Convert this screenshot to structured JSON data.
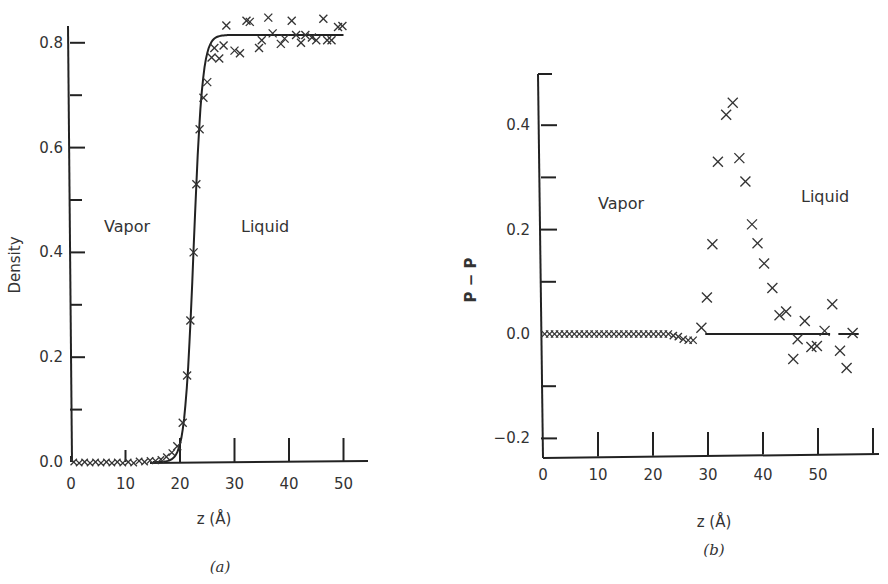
{
  "chart_data": [
    {
      "id": "a",
      "type": "scatter",
      "caption": "(a)",
      "title": "",
      "xlabel": "z (Å)",
      "ylabel": "Density",
      "xlim": [
        0,
        55
      ],
      "ylim": [
        0.0,
        0.85
      ],
      "xticks": [
        0,
        10,
        20,
        30,
        40,
        50
      ],
      "yticks": [
        0.0,
        0.2,
        0.4,
        0.6,
        0.8
      ],
      "ytick_labels": [
        "0.0",
        "0.2",
        "0.4",
        "0.6",
        "0.8"
      ],
      "minor_yticks": [
        0.1,
        0.3,
        0.5,
        0.7
      ],
      "grid": false,
      "annotations": [
        {
          "text": "Vapor",
          "x": 8,
          "y": 0.43
        },
        {
          "text": "Liquid",
          "x": 32,
          "y": 0.43
        }
      ],
      "series": [
        {
          "name": "simulation",
          "style": "x-markers",
          "points": [
            [
              0.5,
              0.0
            ],
            [
              1.5,
              -0.002
            ],
            [
              2.5,
              0.0
            ],
            [
              3.5,
              -0.002
            ],
            [
              4.5,
              0.0
            ],
            [
              5.5,
              -0.002
            ],
            [
              6.5,
              0.0
            ],
            [
              7.5,
              -0.002
            ],
            [
              8.5,
              0.0
            ],
            [
              9.5,
              -0.002
            ],
            [
              10.5,
              0.0
            ],
            [
              11.5,
              -0.002
            ],
            [
              12.5,
              0.002
            ],
            [
              13.5,
              0.0
            ],
            [
              14.5,
              0.003
            ],
            [
              15.5,
              0.002
            ],
            [
              16.5,
              0.005
            ],
            [
              17.5,
              0.01
            ],
            [
              18.5,
              0.018
            ],
            [
              19.5,
              0.03
            ],
            [
              20.5,
              0.075
            ],
            [
              21.3,
              0.165
            ],
            [
              21.9,
              0.27
            ],
            [
              22.5,
              0.4
            ],
            [
              23.0,
              0.53
            ],
            [
              23.6,
              0.635
            ],
            [
              24.3,
              0.695
            ],
            [
              25.0,
              0.725
            ],
            [
              25.8,
              0.772
            ],
            [
              26.3,
              0.79
            ],
            [
              27.2,
              0.77
            ],
            [
              28.0,
              0.795
            ],
            [
              28.5,
              0.833
            ],
            [
              30.0,
              0.785
            ],
            [
              31.0,
              0.78
            ],
            [
              32.2,
              0.842
            ],
            [
              32.8,
              0.84
            ],
            [
              34.5,
              0.79
            ],
            [
              35.0,
              0.805
            ],
            [
              36.2,
              0.848
            ],
            [
              37.0,
              0.818
            ],
            [
              38.5,
              0.798
            ],
            [
              39.2,
              0.808
            ],
            [
              40.5,
              0.842
            ],
            [
              41.3,
              0.815
            ],
            [
              42.2,
              0.8
            ],
            [
              43.0,
              0.815
            ],
            [
              44.2,
              0.81
            ],
            [
              45.0,
              0.805
            ],
            [
              46.3,
              0.846
            ],
            [
              47.0,
              0.805
            ],
            [
              47.8,
              0.805
            ],
            [
              49.0,
              0.83
            ],
            [
              49.8,
              0.832
            ]
          ]
        },
        {
          "name": "fit",
          "style": "line",
          "function": "tanh profile",
          "x_range": [
            15,
            50
          ],
          "rho_vapor": 0.0,
          "rho_liquid": 0.815,
          "z0": 22.5,
          "width": 1.6
        }
      ]
    },
    {
      "id": "b",
      "type": "scatter",
      "caption": "(b)",
      "title": "",
      "xlabel": "z (Å)",
      "ylabel": "P − P",
      "xlim": [
        0,
        60
      ],
      "ylim": [
        -0.22,
        0.5
      ],
      "xticks": [
        0,
        10,
        20,
        30,
        40,
        50,
        60
      ],
      "xtick_labels": [
        "0",
        "10",
        "20",
        "30",
        "40",
        "50",
        ""
      ],
      "yticks": [
        -0.2,
        0.0,
        0.2,
        0.4
      ],
      "ytick_labels": [
        "−0.2",
        "0.0",
        "0.2",
        "0.4"
      ],
      "minor_yticks": [
        -0.1,
        0.1,
        0.3,
        0.5
      ],
      "grid": false,
      "annotations": [
        {
          "text": "Vapor",
          "x": 10,
          "y": 0.22
        },
        {
          "text": "Liquid",
          "x": 51,
          "y": 0.23
        }
      ],
      "series": [
        {
          "name": "simulation",
          "style": "x-markers",
          "points": [
            [
              0.3,
              0.0
            ],
            [
              1.2,
              0.0
            ],
            [
              2.1,
              0.0
            ],
            [
              3.0,
              0.0
            ],
            [
              3.9,
              0.0
            ],
            [
              4.8,
              0.0
            ],
            [
              5.7,
              0.0
            ],
            [
              6.6,
              0.0
            ],
            [
              7.5,
              0.0
            ],
            [
              8.4,
              0.0
            ],
            [
              9.3,
              0.0
            ],
            [
              10.2,
              0.0
            ],
            [
              11.1,
              0.0
            ],
            [
              12.0,
              0.0
            ],
            [
              12.9,
              0.0
            ],
            [
              13.8,
              0.0
            ],
            [
              14.7,
              0.0
            ],
            [
              15.6,
              0.0
            ],
            [
              16.5,
              0.0
            ],
            [
              17.4,
              0.0
            ],
            [
              18.3,
              0.0
            ],
            [
              19.2,
              0.0
            ],
            [
              20.1,
              0.0
            ],
            [
              21.0,
              0.0
            ],
            [
              21.9,
              0.0
            ],
            [
              22.8,
              0.0
            ],
            [
              23.7,
              -0.003
            ],
            [
              24.6,
              -0.005
            ],
            [
              25.5,
              -0.01
            ],
            [
              26.4,
              -0.012
            ],
            [
              27.3,
              -0.012
            ],
            [
              28.8,
              0.012
            ],
            [
              29.8,
              0.07
            ],
            [
              30.8,
              0.172
            ],
            [
              31.8,
              0.33
            ],
            [
              33.3,
              0.42
            ],
            [
              34.5,
              0.443
            ],
            [
              35.7,
              0.337
            ],
            [
              36.8,
              0.292
            ],
            [
              38.0,
              0.21
            ],
            [
              39.0,
              0.174
            ],
            [
              40.2,
              0.135
            ],
            [
              41.7,
              0.088
            ],
            [
              43.0,
              0.036
            ],
            [
              44.2,
              0.043
            ],
            [
              45.5,
              -0.048
            ],
            [
              46.3,
              -0.01
            ],
            [
              47.6,
              0.025
            ],
            [
              48.8,
              -0.025
            ],
            [
              49.8,
              -0.023
            ],
            [
              51.2,
              0.006
            ],
            [
              52.6,
              0.057
            ],
            [
              54.0,
              -0.032
            ],
            [
              55.2,
              -0.065
            ],
            [
              56.3,
              0.002
            ]
          ]
        },
        {
          "name": "reference",
          "style": "line",
          "segments": [
            [
              [
                29.5,
                0.0
              ],
              [
                52.2,
                0.0
              ]
            ],
            [
              [
                53.7,
                0.0
              ],
              [
                57.4,
                0.0
              ]
            ]
          ]
        }
      ]
    }
  ]
}
